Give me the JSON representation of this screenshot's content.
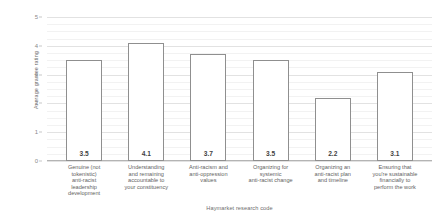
{
  "chart_data": {
    "type": "bar",
    "title": "",
    "xlabel": "Haymarket research code",
    "ylabel": "Average grantee rating",
    "ylim": [
      0,
      5
    ],
    "yticks": [
      "0",
      "1",
      "2",
      "3",
      "4",
      "5"
    ],
    "grid": true,
    "legend": "none",
    "categories": [
      "Genuine (not tokenistic) anti-racist leadership development",
      "Understanding and remaining accountable to your constituency",
      "Anti-racism and anti-oppression values",
      "Organizing for systemic anti-racist change",
      "Organizing an anti-racist plan and timeline",
      "Ensuring that you're sustainable financially to perform the work"
    ],
    "category_lines": [
      [
        "Genuine (not",
        "tokenistic)",
        "anti-racist",
        "leadership",
        "development"
      ],
      [
        "Understanding",
        "and remaining",
        "accountable to",
        "your constituency"
      ],
      [
        "Anti-racism and",
        "anti-oppression",
        "values"
      ],
      [
        "Organizing for",
        "systemic",
        "anti-racist change"
      ],
      [
        "Organizing an",
        "anti-racist plan",
        "and timeline"
      ],
      [
        "Ensuring that",
        "you're sustainable",
        "financially to",
        "perform the work"
      ]
    ],
    "values": [
      3.5,
      4.1,
      3.7,
      3.5,
      2.2,
      3.1
    ],
    "value_labels": [
      "3.5",
      "4.1",
      "3.7",
      "3.5",
      "2.2",
      "3.1"
    ],
    "colors": {
      "bar_fill": "#ffffff",
      "bar_border": "#8f8f8f",
      "gridline": "#e2e2e2",
      "gridline_minor": "#f2f2f2",
      "axis": "#b4b4b4",
      "text": "#6d6d6d",
      "value_text": "#3f3f3f",
      "background": "#ffffff"
    }
  }
}
